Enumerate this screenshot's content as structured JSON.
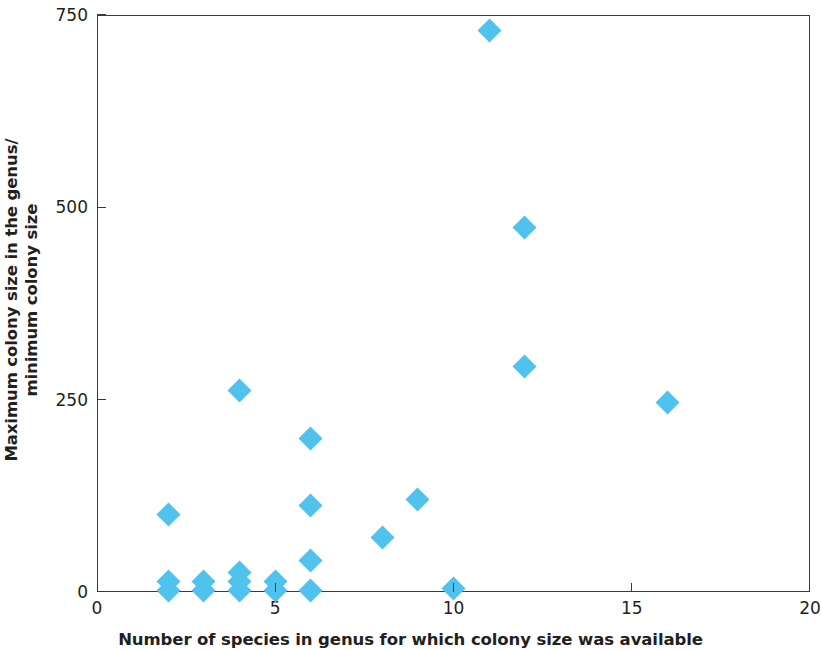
{
  "chart_data": {
    "type": "scatter",
    "title": "",
    "xlabel": "Number of species in genus for which colony size was available",
    "ylabel_line1": "Maximum colony size in the genus/",
    "ylabel_line2": "minimum colony size",
    "xlim": [
      0,
      20
    ],
    "ylim": [
      0,
      750
    ],
    "xticks": [
      0,
      5,
      10,
      15,
      20
    ],
    "yticks": [
      0,
      250,
      500,
      750
    ],
    "xtick_labels": [
      "0",
      "5",
      "10",
      "15",
      "20"
    ],
    "ytick_labels": [
      "0",
      "250",
      "500",
      "750"
    ],
    "grid": false,
    "legend": false,
    "marker": "diamond",
    "marker_color": "#4fc3ee",
    "axis_color": "#3a3a3c",
    "background": "#ffffff",
    "points": [
      {
        "x": 2,
        "y": 2
      },
      {
        "x": 2,
        "y": 14
      },
      {
        "x": 2,
        "y": 101
      },
      {
        "x": 3,
        "y": 2
      },
      {
        "x": 3,
        "y": 14
      },
      {
        "x": 4,
        "y": 2
      },
      {
        "x": 4,
        "y": 13
      },
      {
        "x": 4,
        "y": 25
      },
      {
        "x": 4,
        "y": 262
      },
      {
        "x": 5,
        "y": 2
      },
      {
        "x": 5,
        "y": 14
      },
      {
        "x": 6,
        "y": 2
      },
      {
        "x": 6,
        "y": 41
      },
      {
        "x": 6,
        "y": 112
      },
      {
        "x": 6,
        "y": 200
      },
      {
        "x": 8,
        "y": 71
      },
      {
        "x": 9,
        "y": 120
      },
      {
        "x": 10,
        "y": 5
      },
      {
        "x": 11,
        "y": 730
      },
      {
        "x": 12,
        "y": 474
      },
      {
        "x": 12,
        "y": 293
      },
      {
        "x": 16,
        "y": 246
      }
    ]
  }
}
